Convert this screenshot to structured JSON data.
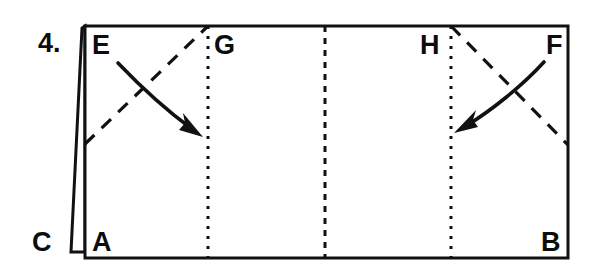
{
  "diagram": {
    "type": "origami-fold-step",
    "step_number": "4.",
    "canvas": {
      "width": 592,
      "height": 276,
      "background": "#ffffff"
    },
    "ink_color": "#111111",
    "paper_outline": {
      "name": "main-paper-rectangle",
      "corners": {
        "top_left": [
          85,
          26
        ],
        "top_right": [
          568,
          26
        ],
        "bottom_right": [
          568,
          258
        ],
        "bottom_left": [
          85,
          258
        ]
      }
    },
    "flap": {
      "name": "left-folded-flap",
      "points": "85,26 82,28 71,252 85,252"
    },
    "vertex_labels": [
      {
        "id": "E",
        "text": "E",
        "x": 92,
        "y": 32,
        "anchor": "top-left"
      },
      {
        "id": "G",
        "text": "G",
        "x": 214,
        "y": 32,
        "anchor": "top-left"
      },
      {
        "id": "H",
        "text": "H",
        "x": 420,
        "y": 32,
        "anchor": "top-left"
      },
      {
        "id": "F",
        "text": "F",
        "x": 546,
        "y": 32,
        "anchor": "top-left"
      },
      {
        "id": "C",
        "text": "C",
        "x": 32,
        "y": 229,
        "anchor": "bottom-left"
      },
      {
        "id": "A",
        "text": "A",
        "x": 92,
        "y": 229,
        "anchor": "bottom-left"
      },
      {
        "id": "B",
        "text": "B",
        "x": 541,
        "y": 229,
        "anchor": "bottom-left"
      }
    ],
    "crease_lines": [
      {
        "name": "crease-g-vertical",
        "style": "dotted",
        "x1": 208,
        "y1": 26,
        "x2": 208,
        "y2": 258
      },
      {
        "name": "crease-center-vertical",
        "style": "dash-dot",
        "x1": 325,
        "y1": 26,
        "x2": 325,
        "y2": 258
      },
      {
        "name": "crease-h-vertical",
        "style": "dotted",
        "x1": 451,
        "y1": 26,
        "x2": 451,
        "y2": 258
      },
      {
        "name": "crease-left-diagonal",
        "style": "dashed",
        "x1": 85,
        "y1": 144,
        "x2": 208,
        "y2": 26
      },
      {
        "name": "crease-right-diagonal",
        "style": "dashed",
        "x1": 451,
        "y1": 26,
        "x2": 568,
        "y2": 145
      }
    ],
    "fold_arrows": [
      {
        "name": "fold-arrow-left",
        "direction": "down-right",
        "path": "M 118 63 C 140 84, 168 108, 194 130"
      },
      {
        "name": "fold-arrow-right",
        "direction": "down-left",
        "path": "M 544 62 C 522 84, 490 108, 464 127"
      }
    ]
  }
}
